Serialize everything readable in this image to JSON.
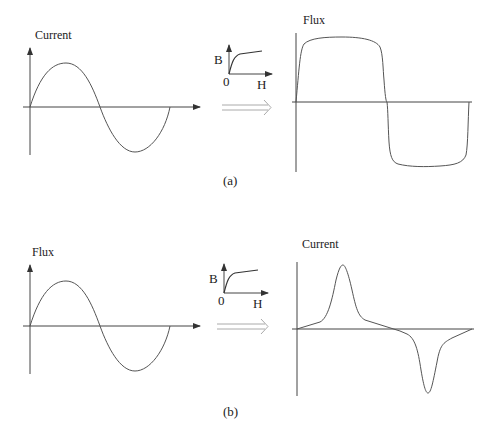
{
  "panels": [
    {
      "id": "a",
      "caption": "(a)",
      "input_plot": {
        "ylabel": "Current",
        "waveform": "sinusoidal"
      },
      "bh_curve": {
        "ylabel": "B",
        "xlabel": "H",
        "origin": "0"
      },
      "output_plot": {
        "ylabel": "Flux",
        "waveform": "flat-topped (saturated) wave"
      }
    },
    {
      "id": "b",
      "caption": "(b)",
      "input_plot": {
        "ylabel": "Flux",
        "waveform": "sinusoidal"
      },
      "bh_curve": {
        "ylabel": "B",
        "xlabel": "H",
        "origin": "0"
      },
      "output_plot": {
        "ylabel": "Current",
        "waveform": "peaked (distorted) wave"
      }
    }
  ],
  "colors": {
    "line": "#555555",
    "text": "#222222",
    "arrow": "#aaaaaa"
  }
}
